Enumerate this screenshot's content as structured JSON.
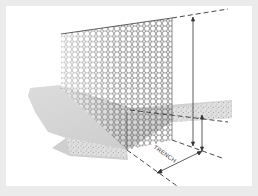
{
  "diagram": {
    "labels": {
      "trench": "TRENCH"
    },
    "colors": {
      "background": "#ebebeb",
      "card": "#ffffff",
      "mesh": "#3a3a3a",
      "ground_top": "#d9d9d9",
      "ground_side": "#c4c4c4",
      "dimension_lines": "#333333"
    },
    "dimensions": [
      {
        "name": "fence-height",
        "type": "vertical-arrow"
      },
      {
        "name": "trench-depth",
        "type": "vertical-arrow"
      },
      {
        "name": "trench-width",
        "type": "diagonal-arrow"
      }
    ]
  }
}
